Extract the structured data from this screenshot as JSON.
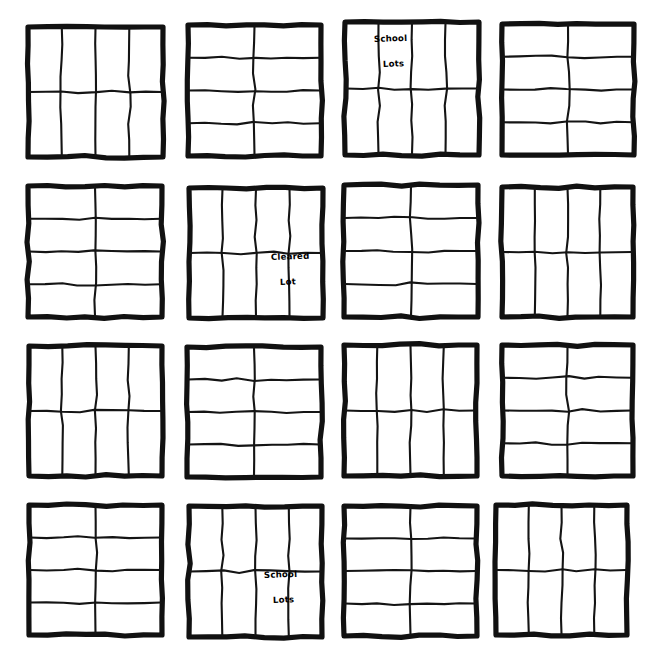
{
  "document": {
    "kind": "hand-drawn-plat-map",
    "title": "",
    "background_color": "#ffffff",
    "ink_color": "#111111",
    "canvas": {
      "width": 655,
      "height": 659
    }
  },
  "grid": {
    "rows": 4,
    "columns": 4,
    "block_count": 16
  },
  "blocks": [
    {
      "id": "block-r1c1",
      "row": 1,
      "column": 1,
      "x": 28,
      "y": 27,
      "width": 135,
      "height": 130,
      "lot_columns": 4,
      "lot_rows": 2,
      "lot_count": 8,
      "labels": []
    },
    {
      "id": "block-r1c2",
      "row": 1,
      "column": 2,
      "x": 188,
      "y": 25,
      "width": 133,
      "height": 131,
      "lot_columns": 2,
      "lot_rows": 4,
      "lot_count": 8,
      "labels": []
    },
    {
      "id": "block-r1c3",
      "row": 1,
      "column": 3,
      "x": 345,
      "y": 22,
      "width": 134,
      "height": 133,
      "lot_columns": 4,
      "lot_rows": 2,
      "lot_count": 8,
      "labels": [
        {
          "id": "label-school-lots-r1c3",
          "line1": "School",
          "line2": "Lots",
          "lot_column": 1,
          "lot_row": 1,
          "x": 374,
          "y": 42
        }
      ]
    },
    {
      "id": "block-r1c4",
      "row": 1,
      "column": 4,
      "x": 502,
      "y": 24,
      "width": 132,
      "height": 131,
      "lot_columns": 2,
      "lot_rows": 4,
      "lot_count": 8,
      "labels": []
    },
    {
      "id": "block-r2c1",
      "row": 2,
      "column": 1,
      "x": 28,
      "y": 186,
      "width": 134,
      "height": 131,
      "lot_columns": 2,
      "lot_rows": 4,
      "lot_count": 8,
      "labels": []
    },
    {
      "id": "block-r2c2",
      "row": 2,
      "column": 2,
      "x": 189,
      "y": 188,
      "width": 134,
      "height": 130,
      "lot_columns": 4,
      "lot_rows": 2,
      "lot_count": 8,
      "labels": [
        {
          "id": "label-cleared-lot-r2c2",
          "line1": "Cleared",
          "line2": "Lot",
          "lot_column": 3,
          "lot_row": 2,
          "x": 271,
          "y": 260
        }
      ]
    },
    {
      "id": "block-r2c3",
      "row": 2,
      "column": 3,
      "x": 344,
      "y": 185,
      "width": 134,
      "height": 132,
      "lot_columns": 2,
      "lot_rows": 4,
      "lot_count": 8,
      "labels": []
    },
    {
      "id": "block-r2c4",
      "row": 2,
      "column": 4,
      "x": 502,
      "y": 187,
      "width": 131,
      "height": 130,
      "lot_columns": 4,
      "lot_rows": 2,
      "lot_count": 8,
      "labels": []
    },
    {
      "id": "block-r3c1",
      "row": 3,
      "column": 1,
      "x": 29,
      "y": 346,
      "width": 133,
      "height": 130,
      "lot_columns": 4,
      "lot_rows": 2,
      "lot_count": 8,
      "labels": []
    },
    {
      "id": "block-r3c2",
      "row": 3,
      "column": 2,
      "x": 187,
      "y": 347,
      "width": 134,
      "height": 130,
      "lot_columns": 2,
      "lot_rows": 4,
      "lot_count": 8,
      "labels": []
    },
    {
      "id": "block-r3c3",
      "row": 3,
      "column": 3,
      "x": 344,
      "y": 345,
      "width": 133,
      "height": 131,
      "lot_columns": 4,
      "lot_rows": 2,
      "lot_count": 8,
      "labels": []
    },
    {
      "id": "block-r3c4",
      "row": 3,
      "column": 4,
      "x": 502,
      "y": 345,
      "width": 131,
      "height": 131,
      "lot_columns": 2,
      "lot_rows": 4,
      "lot_count": 8,
      "labels": []
    },
    {
      "id": "block-r4c1",
      "row": 4,
      "column": 1,
      "x": 29,
      "y": 505,
      "width": 133,
      "height": 130,
      "lot_columns": 2,
      "lot_rows": 4,
      "lot_count": 8,
      "labels": []
    },
    {
      "id": "block-r4c2",
      "row": 4,
      "column": 2,
      "x": 189,
      "y": 506,
      "width": 133,
      "height": 131,
      "lot_columns": 4,
      "lot_rows": 2,
      "lot_count": 8,
      "labels": [
        {
          "id": "label-school-lots-r4c2",
          "line1": "School",
          "line2": "Lots",
          "lot_column": 3,
          "lot_row": 2,
          "x": 264,
          "y": 578
        }
      ]
    },
    {
      "id": "block-r4c3",
      "row": 4,
      "column": 3,
      "x": 344,
      "y": 506,
      "width": 133,
      "height": 130,
      "lot_columns": 2,
      "lot_rows": 4,
      "lot_count": 8,
      "labels": []
    },
    {
      "id": "block-r4c4",
      "row": 4,
      "column": 4,
      "x": 496,
      "y": 505,
      "width": 131,
      "height": 130,
      "lot_columns": 4,
      "lot_rows": 2,
      "lot_count": 8,
      "labels": []
    }
  ],
  "annotations": [
    {
      "text": "School Lots",
      "block": "block-r1c3"
    },
    {
      "text": "Cleared Lot",
      "block": "block-r2c2"
    },
    {
      "text": "School Lots",
      "block": "block-r4c2"
    }
  ]
}
